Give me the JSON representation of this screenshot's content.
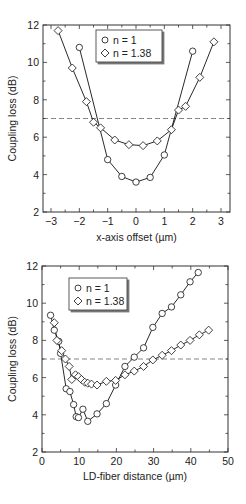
{
  "chart_data": [
    {
      "type": "line",
      "xlabel": "x-axis offset (µm)",
      "ylabel": "Coupling loss (dB)",
      "xlim": [
        -3.3,
        3.3
      ],
      "ylim": [
        2,
        12
      ],
      "xticks": [
        -3,
        -2,
        -1,
        0,
        1,
        2,
        3
      ],
      "yticks": [
        2,
        4,
        6,
        8,
        10,
        12
      ],
      "grid": false,
      "reference_line": {
        "y": 7,
        "style": "dashed"
      },
      "legend": {
        "position": "upper center",
        "entries": [
          "n = 1",
          "n = 1.38"
        ]
      },
      "series": [
        {
          "name": "n = 1",
          "marker": "circle",
          "x": [
            -2.0,
            -1.0,
            -0.5,
            0.0,
            0.5,
            1.0,
            2.0
          ],
          "y": [
            10.8,
            4.8,
            3.9,
            3.6,
            3.85,
            5.05,
            10.6
          ]
        },
        {
          "name": "n = 1.38",
          "marker": "diamond",
          "x": [
            -2.75,
            -2.25,
            -1.75,
            -1.5,
            -1.25,
            -0.75,
            -0.25,
            0.25,
            0.75,
            1.25,
            1.5,
            1.75,
            2.25,
            2.75
          ],
          "y": [
            11.7,
            9.7,
            7.9,
            6.8,
            6.5,
            5.85,
            5.6,
            5.55,
            5.8,
            6.4,
            7.45,
            7.65,
            9.2,
            11.1
          ]
        }
      ]
    },
    {
      "type": "line",
      "xlabel": "LD-fiber distance (µm)",
      "ylabel": "Coupling loss (dB)",
      "xlim": [
        0,
        50
      ],
      "ylim": [
        2,
        12
      ],
      "xticks": [
        0,
        10,
        20,
        30,
        40,
        50
      ],
      "yticks": [
        2,
        4,
        6,
        8,
        10,
        12
      ],
      "grid": false,
      "reference_line": {
        "y": 7,
        "style": "dashed"
      },
      "legend": {
        "position": "upper left",
        "entries": [
          "n = 1",
          "n = 1.38"
        ]
      },
      "series": [
        {
          "name": "n = 1",
          "marker": "circle",
          "x": [
            2.3,
            3.3,
            4.5,
            5.0,
            6.5,
            7.5,
            8.5,
            9.2,
            9.8,
            11.0,
            12.3,
            14.8,
            17.3,
            19.8,
            22.3,
            24.8,
            27.3,
            29.8,
            32.3,
            34.8,
            37.3,
            39.8,
            42.0
          ],
          "y": [
            9.35,
            8.55,
            7.95,
            7.3,
            5.4,
            5.25,
            4.55,
            3.9,
            3.85,
            4.3,
            3.65,
            4.05,
            4.6,
            5.6,
            6.6,
            7.1,
            7.6,
            8.7,
            9.45,
            9.8,
            10.45,
            11.15,
            11.65
          ]
        },
        {
          "name": "n = 1.38",
          "marker": "diamond",
          "x": [
            3.3,
            4.0,
            5.3,
            6.3,
            7.3,
            8.0,
            9.0,
            9.8,
            10.6,
            11.5,
            12.3,
            13.3,
            14.8,
            17.3,
            19.8,
            22.3,
            24.8,
            27.3,
            29.8,
            32.3,
            34.8,
            37.3,
            39.8,
            42.3,
            44.8
          ],
          "y": [
            8.95,
            8.0,
            7.45,
            7.0,
            6.6,
            5.9,
            6.15,
            6.05,
            5.9,
            5.75,
            5.7,
            5.65,
            5.6,
            5.8,
            5.85,
            6.15,
            6.35,
            6.6,
            6.95,
            7.2,
            7.45,
            7.75,
            8.0,
            8.3,
            8.55
          ]
        }
      ]
    }
  ]
}
